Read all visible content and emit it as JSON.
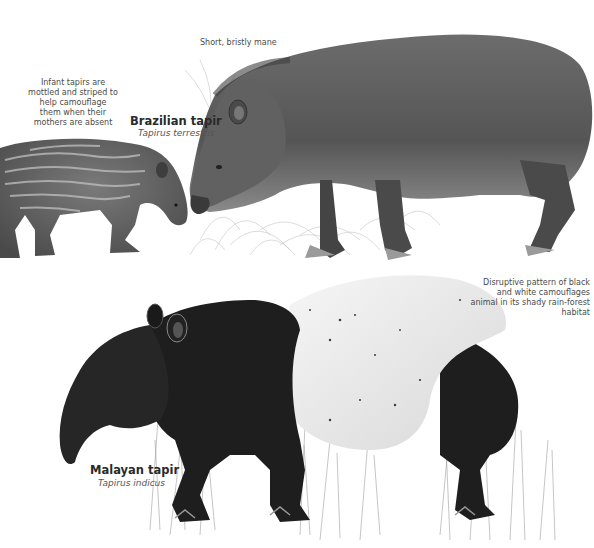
{
  "captions": {
    "infant": "Infant tapirs are mottled and striped to help camouflage them when their mothers are absent",
    "mane": "Short, bristly mane",
    "camouflage": "Disruptive pattern of black and white camouflages animal in its shady rain-forest habitat"
  },
  "species": [
    {
      "common_name": "Brazilian tapir",
      "latin_name": "Tapirus terrestris"
    },
    {
      "common_name": "Malayan tapir",
      "latin_name": "Tapirus indicus"
    }
  ],
  "colors": {
    "background": "#ffffff",
    "brazilian_body": "#5a5a5a",
    "brazilian_shadow": "#3c3c3c",
    "malayan_black": "#1e1e1e",
    "malayan_white": "#eeeeee",
    "infant_body": "#6a6a6a",
    "infant_stripes": "#b8b8b8",
    "grass": "#9a9a9a"
  }
}
